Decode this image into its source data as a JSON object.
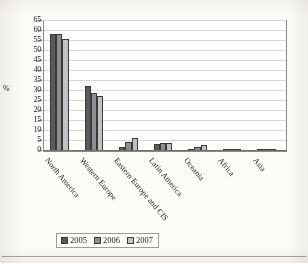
{
  "chart_data": {
    "type": "bar",
    "title": "",
    "subtitle": "",
    "xlabel": "",
    "ylabel": "%",
    "ylim": [
      0,
      65
    ],
    "yticks": [
      0,
      5,
      10,
      15,
      20,
      25,
      30,
      35,
      40,
      45,
      50,
      55,
      60,
      65
    ],
    "grid": true,
    "legend_position": "bottom",
    "categories": [
      "North America",
      "Western Europe",
      "Eastern Europe and CIS",
      "Latin America",
      "Oceania",
      "Africa",
      "Asia"
    ],
    "series": [
      {
        "name": "2005",
        "color": "#5a5a5a",
        "values": [
          58.5,
          32.5,
          2.0,
          3.5,
          1.0,
          1.0,
          0.3
        ]
      },
      {
        "name": "2006",
        "color": "#8e8e8e",
        "values": [
          58.5,
          29.0,
          4.5,
          4.0,
          2.0,
          0.5,
          0.3
        ]
      },
      {
        "name": "2007",
        "color": "#c2c2c2",
        "values": [
          56.0,
          27.5,
          6.5,
          4.0,
          3.0,
          0.5,
          0.3
        ]
      }
    ]
  },
  "legend": {
    "items": [
      {
        "label": "2005",
        "color": "#5a5a5a"
      },
      {
        "label": "2006",
        "color": "#8e8e8e"
      },
      {
        "label": "2007",
        "color": "#c2c2c2"
      }
    ]
  },
  "axis": {
    "y_title": "%"
  }
}
